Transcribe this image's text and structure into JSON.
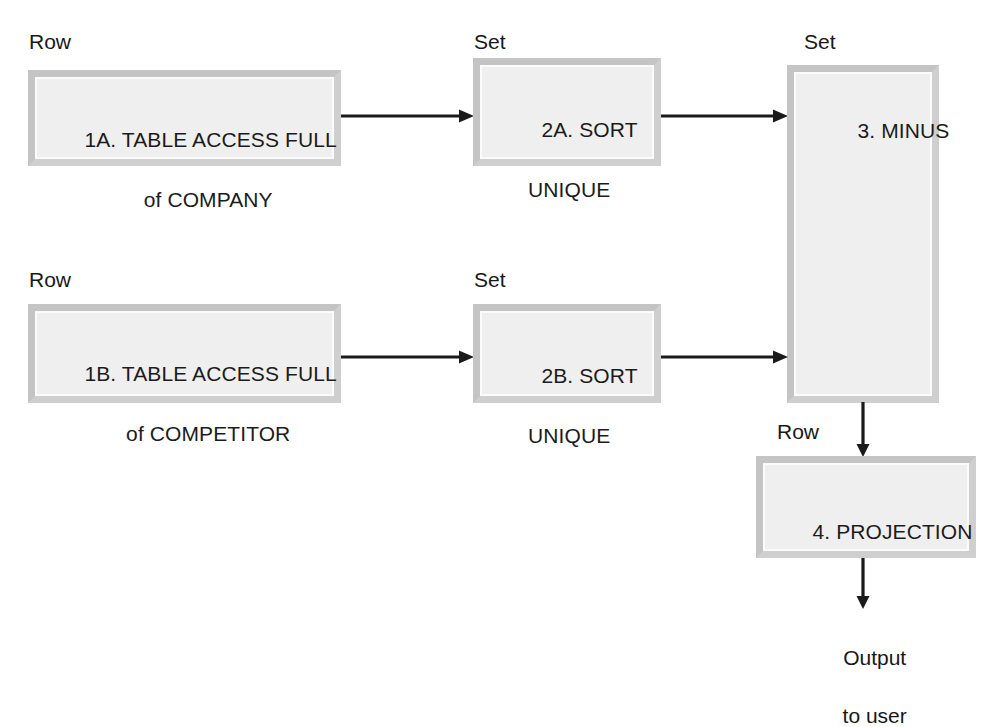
{
  "diagram": {
    "nodes": [
      {
        "id": "1a",
        "label_above": "Row",
        "line1": "1A. TABLE ACCESS FULL",
        "line2": "of COMPANY"
      },
      {
        "id": "2a",
        "label_above": "Set",
        "line1": "2A. SORT",
        "line2": "UNIQUE"
      },
      {
        "id": "minus",
        "label_above": "Set",
        "line1": "3. MINUS",
        "line2": ""
      },
      {
        "id": "1b",
        "label_above": "Row",
        "line1": "1B. TABLE ACCESS FULL",
        "line2": "of COMPETITOR"
      },
      {
        "id": "2b",
        "label_above": "Set",
        "line1": "2B. SORT",
        "line2": "UNIQUE"
      },
      {
        "id": "proj",
        "label_above": "Row",
        "line1": "4. PROJECTION",
        "line2": ""
      }
    ],
    "output": {
      "line1": "Output",
      "line2": "to user"
    },
    "colors": {
      "box_fill": "#efefef",
      "box_border": "#c9c9c9",
      "arrow": "#1a1a1a",
      "text": "#1b1b1b",
      "background": "#ffffff"
    }
  }
}
